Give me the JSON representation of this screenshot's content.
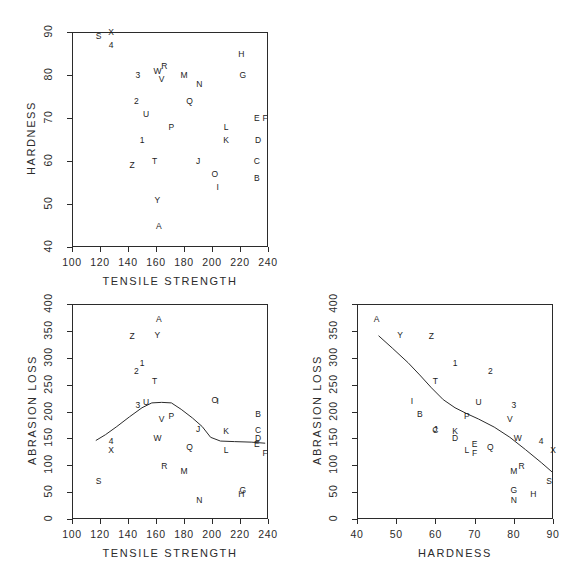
{
  "figure": {
    "background": "#ffffff",
    "ink": "#2b2b2b",
    "panel_count": 3
  },
  "chart_data": [
    {
      "id": "hardness-vs-tensile",
      "type": "scatter",
      "title": "",
      "xlabel": "TENSILE STRENGTH",
      "ylabel": "HARDNESS",
      "xlim": [
        100,
        240
      ],
      "ylim": [
        40,
        90
      ],
      "xticks": [
        100,
        120,
        140,
        160,
        180,
        200,
        220,
        240
      ],
      "yticks": [
        40,
        50,
        60,
        70,
        80,
        90
      ],
      "grid": false,
      "legend": "none",
      "marker_style": "letter-labels",
      "points": [
        {
          "label": "S",
          "x": 119,
          "y": 89
        },
        {
          "label": "X",
          "x": 128,
          "y": 90
        },
        {
          "label": "4",
          "x": 128,
          "y": 87
        },
        {
          "label": "3",
          "x": 147,
          "y": 80
        },
        {
          "label": "W",
          "x": 161,
          "y": 81
        },
        {
          "label": "R",
          "x": 166,
          "y": 82
        },
        {
          "label": "V",
          "x": 164,
          "y": 79
        },
        {
          "label": "M",
          "x": 180,
          "y": 80
        },
        {
          "label": "N",
          "x": 191,
          "y": 78
        },
        {
          "label": "H",
          "x": 221,
          "y": 85
        },
        {
          "label": "G",
          "x": 222,
          "y": 80
        },
        {
          "label": "2",
          "x": 146,
          "y": 74
        },
        {
          "label": "Q",
          "x": 184,
          "y": 74
        },
        {
          "label": "U",
          "x": 153,
          "y": 71
        },
        {
          "label": "E",
          "x": 232,
          "y": 70
        },
        {
          "label": "F",
          "x": 238,
          "y": 70
        },
        {
          "label": "P",
          "x": 171,
          "y": 68
        },
        {
          "label": "L",
          "x": 210,
          "y": 68
        },
        {
          "label": "1",
          "x": 150,
          "y": 65
        },
        {
          "label": "K",
          "x": 210,
          "y": 65
        },
        {
          "label": "D",
          "x": 233,
          "y": 65
        },
        {
          "label": "Z",
          "x": 143,
          "y": 59
        },
        {
          "label": "T",
          "x": 159,
          "y": 60
        },
        {
          "label": "J",
          "x": 190,
          "y": 60
        },
        {
          "label": "C",
          "x": 232,
          "y": 60
        },
        {
          "label": "O",
          "x": 202,
          "y": 57
        },
        {
          "label": "B",
          "x": 232,
          "y": 56
        },
        {
          "label": "I",
          "x": 204,
          "y": 54
        },
        {
          "label": "Y",
          "x": 161,
          "y": 51
        },
        {
          "label": "A",
          "x": 162,
          "y": 45
        }
      ]
    },
    {
      "id": "abrasion-vs-tensile",
      "type": "scatter",
      "title": "",
      "xlabel": "TENSILE STRENGTH",
      "ylabel": "ABRASION LOSS",
      "xlim": [
        100,
        240
      ],
      "ylim": [
        0,
        400
      ],
      "xticks": [
        100,
        120,
        140,
        160,
        180,
        200,
        220,
        240
      ],
      "yticks": [
        0,
        50,
        100,
        150,
        200,
        250,
        300,
        350,
        400
      ],
      "grid": false,
      "legend": "none",
      "marker_style": "letter-labels",
      "has_smoother": true,
      "points": [
        {
          "label": "A",
          "x": 162,
          "y": 372
        },
        {
          "label": "Z",
          "x": 143,
          "y": 341
        },
        {
          "label": "Y",
          "x": 161,
          "y": 342
        },
        {
          "label": "1",
          "x": 150,
          "y": 290
        },
        {
          "label": "2",
          "x": 146,
          "y": 276
        },
        {
          "label": "T",
          "x": 159,
          "y": 257
        },
        {
          "label": "3",
          "x": 147,
          "y": 213
        },
        {
          "label": "U",
          "x": 153,
          "y": 218
        },
        {
          "label": "O",
          "x": 202,
          "y": 222
        },
        {
          "label": "I",
          "x": 204,
          "y": 219
        },
        {
          "label": "B",
          "x": 233,
          "y": 196
        },
        {
          "label": "V",
          "x": 164,
          "y": 186
        },
        {
          "label": "P",
          "x": 171,
          "y": 192
        },
        {
          "label": "J",
          "x": 190,
          "y": 168
        },
        {
          "label": "K",
          "x": 210,
          "y": 164
        },
        {
          "label": "C",
          "x": 233,
          "y": 166
        },
        {
          "label": "4",
          "x": 128,
          "y": 146
        },
        {
          "label": "W",
          "x": 161,
          "y": 150
        },
        {
          "label": "D",
          "x": 233,
          "y": 150
        },
        {
          "label": "E",
          "x": 232,
          "y": 140
        },
        {
          "label": "Q",
          "x": 184,
          "y": 134
        },
        {
          "label": "L",
          "x": 210,
          "y": 128
        },
        {
          "label": "F",
          "x": 238,
          "y": 122
        },
        {
          "label": "X",
          "x": 128,
          "y": 128
        },
        {
          "label": "R",
          "x": 166,
          "y": 98
        },
        {
          "label": "M",
          "x": 180,
          "y": 89
        },
        {
          "label": "S",
          "x": 119,
          "y": 70
        },
        {
          "label": "G",
          "x": 222,
          "y": 54
        },
        {
          "label": "H",
          "x": 221,
          "y": 47
        },
        {
          "label": "N",
          "x": 191,
          "y": 36
        }
      ],
      "smoother": [
        {
          "x": 117,
          "y": 146
        },
        {
          "x": 124,
          "y": 157
        },
        {
          "x": 132,
          "y": 172
        },
        {
          "x": 141,
          "y": 190
        },
        {
          "x": 150,
          "y": 207
        },
        {
          "x": 157,
          "y": 216
        },
        {
          "x": 164,
          "y": 217
        },
        {
          "x": 171,
          "y": 216
        },
        {
          "x": 178,
          "y": 204
        },
        {
          "x": 186,
          "y": 188
        },
        {
          "x": 193,
          "y": 172
        },
        {
          "x": 199,
          "y": 152
        },
        {
          "x": 206,
          "y": 145
        },
        {
          "x": 216,
          "y": 144
        },
        {
          "x": 228,
          "y": 143
        },
        {
          "x": 238,
          "y": 141
        }
      ]
    },
    {
      "id": "abrasion-vs-hardness",
      "type": "scatter",
      "title": "",
      "xlabel": "HARDNESS",
      "ylabel": "ABRASION LOSS",
      "xlim": [
        40,
        90
      ],
      "ylim": [
        0,
        400
      ],
      "xticks": [
        40,
        50,
        60,
        70,
        80,
        90
      ],
      "yticks": [
        0,
        50,
        100,
        150,
        200,
        250,
        300,
        350,
        400
      ],
      "grid": false,
      "legend": "none",
      "marker_style": "letter-labels",
      "has_smoother": true,
      "points": [
        {
          "label": "A",
          "x": 45,
          "y": 372
        },
        {
          "label": "Y",
          "x": 51,
          "y": 342
        },
        {
          "label": "Z",
          "x": 59,
          "y": 341
        },
        {
          "label": "1",
          "x": 65,
          "y": 290
        },
        {
          "label": "2",
          "x": 74,
          "y": 276
        },
        {
          "label": "T",
          "x": 60,
          "y": 257
        },
        {
          "label": "I",
          "x": 54,
          "y": 219
        },
        {
          "label": "D",
          "x": 65,
          "y": 150
        },
        {
          "label": "B",
          "x": 56,
          "y": 196
        },
        {
          "label": "U",
          "x": 71,
          "y": 218
        },
        {
          "label": "3",
          "x": 80,
          "y": 213
        },
        {
          "label": "P",
          "x": 68,
          "y": 192
        },
        {
          "label": "V",
          "x": 79,
          "y": 186
        },
        {
          "label": "C",
          "x": 60,
          "y": 166
        },
        {
          "label": "J",
          "x": 60,
          "y": 168
        },
        {
          "label": "K",
          "x": 65,
          "y": 164
        },
        {
          "label": "W",
          "x": 81,
          "y": 150
        },
        {
          "label": "4",
          "x": 87,
          "y": 146
        },
        {
          "label": "E",
          "x": 70,
          "y": 140
        },
        {
          "label": "Q",
          "x": 74,
          "y": 134
        },
        {
          "label": "L",
          "x": 68,
          "y": 128
        },
        {
          "label": "F",
          "x": 70,
          "y": 122
        },
        {
          "label": "X",
          "x": 90,
          "y": 128
        },
        {
          "label": "R",
          "x": 82,
          "y": 98
        },
        {
          "label": "M",
          "x": 80,
          "y": 89
        },
        {
          "label": "S",
          "x": 89,
          "y": 70
        },
        {
          "label": "G",
          "x": 80,
          "y": 54
        },
        {
          "label": "H",
          "x": 85,
          "y": 47
        },
        {
          "label": "N",
          "x": 80,
          "y": 36
        }
      ],
      "smoother": [
        {
          "x": 45.5,
          "y": 341
        },
        {
          "x": 49,
          "y": 318
        },
        {
          "x": 53,
          "y": 291
        },
        {
          "x": 56,
          "y": 268
        },
        {
          "x": 59,
          "y": 244
        },
        {
          "x": 62,
          "y": 222
        },
        {
          "x": 65,
          "y": 207
        },
        {
          "x": 68,
          "y": 196
        },
        {
          "x": 71,
          "y": 186
        },
        {
          "x": 75,
          "y": 171
        },
        {
          "x": 79,
          "y": 152
        },
        {
          "x": 83,
          "y": 129
        },
        {
          "x": 87,
          "y": 105
        },
        {
          "x": 90,
          "y": 86
        }
      ]
    }
  ]
}
